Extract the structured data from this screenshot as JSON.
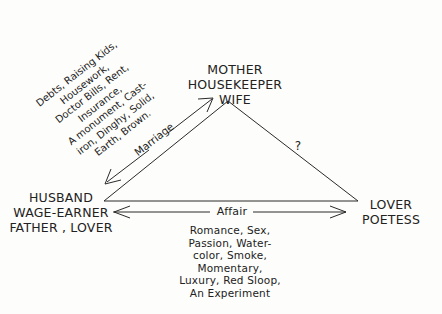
{
  "nodes": {
    "top": [
      "MOTHER",
      "HOUSEKEEPER",
      "WIFE"
    ],
    "left": [
      "HUSBAND",
      "WAGE-EARNER",
      "FATHER ,  LOVER"
    ],
    "right": [
      "LOVER",
      "POETESS"
    ]
  },
  "edges": {
    "marriage": {
      "label": "Marriage",
      "attributes": [
        "Debts, Raising Kids,",
        "Housework,",
        "Doctor Bills, Rent,",
        "Insurance,",
        "A monument, Cast-",
        "iron, Dinghy, Solid,",
        "Earth, Brown."
      ]
    },
    "affair": {
      "label": "Affair",
      "attributes": [
        "Romance, Sex,",
        "Passion, Water-",
        "color, Smoke,",
        "Momentary,",
        "Luxury, Red Sloop,",
        "An Experiment"
      ]
    },
    "unknown": {
      "label": "?"
    }
  },
  "colors": {
    "ink": "#222222",
    "paper": "#fdfdfb"
  }
}
